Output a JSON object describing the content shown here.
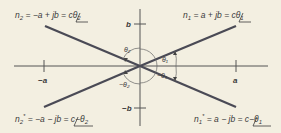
{
  "diagram": {
    "type": "complex-plane phasor diagram",
    "colors": {
      "background": "#f3efe1",
      "axis": "#555555",
      "vector": "#4a4a55",
      "text": "#3a3a3a"
    },
    "axes": {
      "x_ticks": {
        "negative": "−a",
        "positive": "a"
      },
      "y_ticks": {
        "positive": "b",
        "negative": "−b"
      }
    },
    "vectors": [
      {
        "id": "n1",
        "label_lhs": "n",
        "sub": "1",
        "expr": " = a + jb = c",
        "angle": "θ",
        "angle_sub": "1",
        "sign": ""
      },
      {
        "id": "n2",
        "label_lhs": "n",
        "sub": "2",
        "expr": " = −a + jb = c",
        "angle": "θ",
        "angle_sub": "2",
        "sign": ""
      },
      {
        "id": "n2star",
        "label_lhs": "n",
        "sub": "2",
        "sup": "*",
        "expr": " = −a − jb = c",
        "angle": "θ",
        "angle_sub": "2",
        "sign": "−"
      },
      {
        "id": "n1star",
        "label_lhs": "n",
        "sub": "1",
        "sup": "*",
        "expr": " = a − jb = c",
        "angle": "θ",
        "angle_sub": "1",
        "sign": "−"
      }
    ],
    "angle_labels": {
      "theta1": "θ₁",
      "neg_theta1": "−θ₁",
      "theta2": "θ₂",
      "neg_theta2": "−θ₂"
    }
  }
}
